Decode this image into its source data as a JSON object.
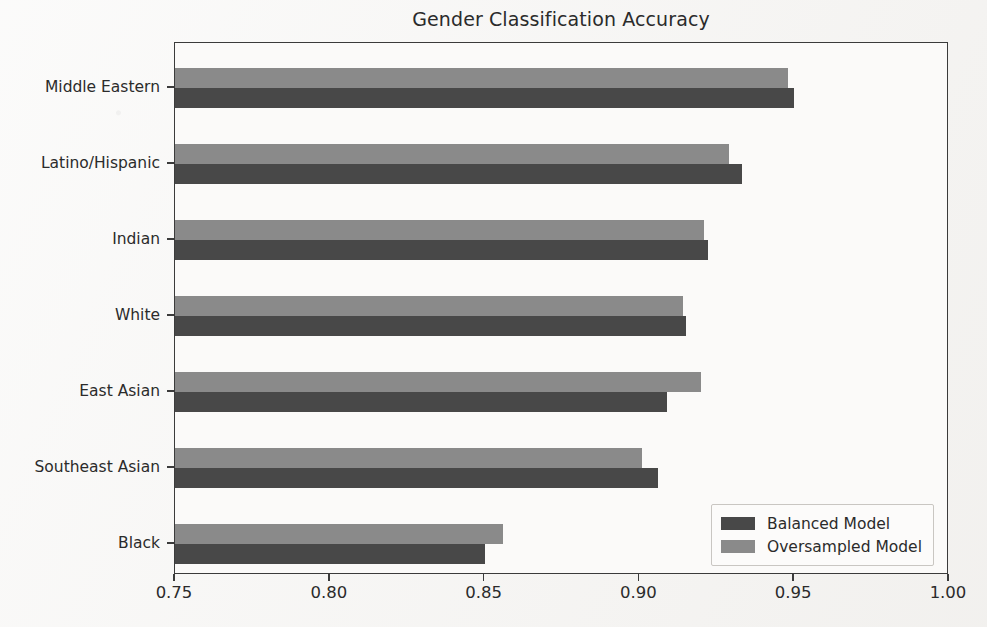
{
  "chart_data": {
    "type": "bar",
    "orientation": "horizontal",
    "title": "Gender Classification Accuracy",
    "xlabel": "",
    "ylabel": "",
    "xlim": [
      0.75,
      1.0
    ],
    "xticks": [
      0.75,
      0.8,
      0.85,
      0.9,
      0.95,
      1.0
    ],
    "xtick_labels": [
      "0.75",
      "0.80",
      "0.85",
      "0.90",
      "0.95",
      "1.00"
    ],
    "grid": false,
    "legend_position": "lower right",
    "categories": [
      "Middle Eastern",
      "Latino/Hispanic",
      "Indian",
      "White",
      "East Asian",
      "Southeast Asian",
      "Black"
    ],
    "series": [
      {
        "name": "Balanced Model",
        "color": "#484848",
        "values": [
          0.95,
          0.933,
          0.922,
          0.915,
          0.909,
          0.906,
          0.85
        ]
      },
      {
        "name": "Oversampled Model",
        "color": "#8a8a8a",
        "values": [
          0.948,
          0.929,
          0.921,
          0.914,
          0.92,
          0.901,
          0.856
        ]
      }
    ]
  },
  "legend": {
    "entries": [
      {
        "label": "Balanced Model",
        "color": "#484848"
      },
      {
        "label": "Oversampled Model",
        "color": "#8a8a8a"
      }
    ]
  },
  "colors": {
    "balanced": "#484848",
    "oversampled": "#8a8a8a",
    "axis": "#3b3b3b",
    "text": "#2b2b2b",
    "background": "#f4f3f1"
  }
}
